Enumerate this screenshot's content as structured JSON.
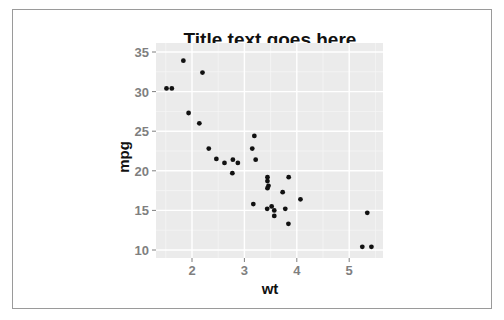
{
  "chart_data": {
    "type": "scatter",
    "title": "Title text goes here",
    "xlabel": "wt",
    "ylabel": "mpg",
    "xlim": [
      1.3,
      5.65
    ],
    "ylim": [
      9,
      36
    ],
    "x_ticks": [
      2,
      3,
      4,
      5
    ],
    "y_ticks": [
      10,
      15,
      20,
      25,
      30,
      35
    ],
    "grid": true,
    "legend": null,
    "panel_background": "#ebebeb",
    "point_color": "#111111",
    "points": [
      {
        "wt": 2.62,
        "mpg": 21.0
      },
      {
        "wt": 2.875,
        "mpg": 21.0
      },
      {
        "wt": 2.32,
        "mpg": 22.8
      },
      {
        "wt": 3.215,
        "mpg": 21.4
      },
      {
        "wt": 3.44,
        "mpg": 18.7
      },
      {
        "wt": 3.46,
        "mpg": 18.1
      },
      {
        "wt": 3.57,
        "mpg": 14.3
      },
      {
        "wt": 3.19,
        "mpg": 24.4
      },
      {
        "wt": 3.15,
        "mpg": 22.8
      },
      {
        "wt": 3.44,
        "mpg": 19.2
      },
      {
        "wt": 3.44,
        "mpg": 17.8
      },
      {
        "wt": 4.07,
        "mpg": 16.4
      },
      {
        "wt": 3.73,
        "mpg": 17.3
      },
      {
        "wt": 3.78,
        "mpg": 15.2
      },
      {
        "wt": 5.25,
        "mpg": 10.4
      },
      {
        "wt": 5.424,
        "mpg": 10.4
      },
      {
        "wt": 5.345,
        "mpg": 14.7
      },
      {
        "wt": 2.2,
        "mpg": 32.4
      },
      {
        "wt": 1.615,
        "mpg": 30.4
      },
      {
        "wt": 1.835,
        "mpg": 33.9
      },
      {
        "wt": 2.465,
        "mpg": 21.5
      },
      {
        "wt": 3.52,
        "mpg": 15.5
      },
      {
        "wt": 3.435,
        "mpg": 15.2
      },
      {
        "wt": 3.84,
        "mpg": 13.3
      },
      {
        "wt": 3.845,
        "mpg": 19.2
      },
      {
        "wt": 1.935,
        "mpg": 27.3
      },
      {
        "wt": 2.14,
        "mpg": 26.0
      },
      {
        "wt": 1.513,
        "mpg": 30.4
      },
      {
        "wt": 3.17,
        "mpg": 15.8
      },
      {
        "wt": 2.77,
        "mpg": 19.7
      },
      {
        "wt": 3.57,
        "mpg": 15.0
      },
      {
        "wt": 2.78,
        "mpg": 21.4
      }
    ]
  }
}
